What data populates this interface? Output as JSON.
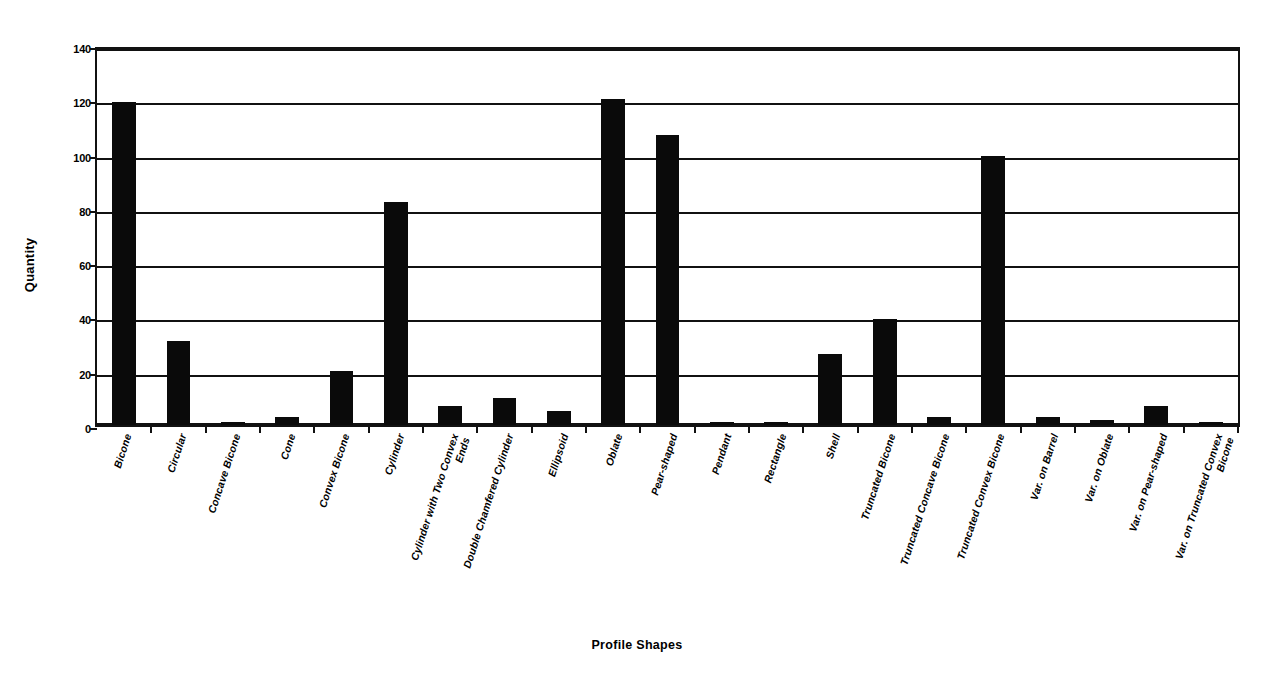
{
  "chart_data": {
    "type": "bar",
    "title": "",
    "xlabel": "Profile Shapes",
    "ylabel": "Quantity",
    "ylim": [
      0,
      140
    ],
    "yticks": [
      0,
      20,
      40,
      60,
      80,
      100,
      120,
      140
    ],
    "grid": true,
    "legend": false,
    "bar_color": "#0a0a0a",
    "categories": [
      "Bicone",
      "Circular",
      "Concave Bicone",
      "Cone",
      "Convex Bicone",
      "Cylinder",
      "Cylinder with Two Convex Ends",
      "Double Chamfered Cylinder",
      "Ellipsoid",
      "Oblate",
      "Pear-shaped",
      "Pendant",
      "Rectangle",
      "Shell",
      "Truncated Bicone",
      "Truncated Concave Bicone",
      "Truncated Convex Bicone",
      "Var. on Barrel",
      "Var. on Oblate",
      "Var. on Pear-shaped",
      "Var. on Truncated Convex Bicone"
    ],
    "values": [
      119,
      31,
      1,
      3,
      20,
      82,
      7,
      10,
      5,
      120,
      107,
      1,
      1,
      26,
      39,
      3,
      99,
      3,
      2,
      7,
      1
    ]
  },
  "axes": {
    "y_title": "Quantity",
    "x_title": "Profile Shapes",
    "y_tick_labels": [
      "0",
      "20",
      "40",
      "60",
      "80",
      "100",
      "120",
      "140"
    ]
  }
}
